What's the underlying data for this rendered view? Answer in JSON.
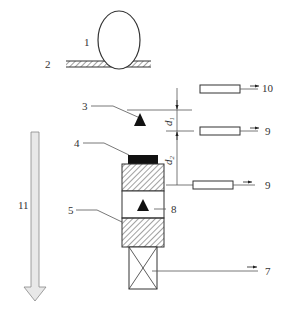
{
  "diagram": {
    "type": "schematic",
    "labels": {
      "l1": "1",
      "l2": "2",
      "l3": "3",
      "l4": "4",
      "l5": "5",
      "l7": "7",
      "l8": "8",
      "l9a": "9",
      "l9b": "9",
      "l10": "10",
      "l11": "11",
      "d1": "d",
      "d1sub": "1",
      "d2": "d",
      "d2sub": "2"
    },
    "elements": [
      {
        "id": "1",
        "shape": "circle-on-surface"
      },
      {
        "id": "2",
        "shape": "hatched-surface"
      },
      {
        "id": "3",
        "shape": "triangle-marker"
      },
      {
        "id": "4",
        "shape": "black-block-top"
      },
      {
        "id": "5",
        "shape": "hatched-block-lower"
      },
      {
        "id": "7",
        "shape": "crossed-box"
      },
      {
        "id": "8",
        "shape": "triangle-marker-inside-box"
      },
      {
        "id": "9",
        "shape": "bar-with-arrow",
        "count": 2
      },
      {
        "id": "10",
        "shape": "bar-with-arrow"
      },
      {
        "id": "11",
        "shape": "large-downward-arrow"
      }
    ],
    "colors": {
      "line": "#333333",
      "fill_black": "#111111",
      "arrow_fill": "#e8e8e8"
    }
  }
}
